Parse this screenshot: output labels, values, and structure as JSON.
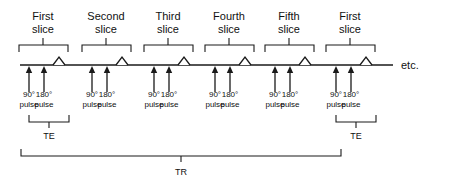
{
  "diagram": {
    "title_text": "Multi-slice spin echo pulse sequence timing diagram",
    "etc_label": "etc.",
    "axis": {
      "x_start": 20,
      "x_end": 393,
      "y": 65
    },
    "colors": {
      "ink": "#1a1a1a",
      "background": "#ffffff",
      "text": "#111111"
    },
    "slices": [
      {
        "ordinal_word": "First",
        "slice_word": "slice",
        "bracket_left": 19,
        "bracket_right": 68,
        "bracket_y": 45,
        "bracket_tick_x": 43,
        "label_x": 43,
        "pulse_90_x": 29,
        "pulse_180_x": 44,
        "echo_x": 59,
        "pulse_90_label": "90°",
        "pulse_90_sub": "pulse",
        "pulse_180_label": "180°",
        "pulse_180_sub": "pulse",
        "te_bracket": true,
        "te_label": "TE"
      },
      {
        "ordinal_word": "Second",
        "slice_word": "slice",
        "bracket_left": 82,
        "bracket_right": 131,
        "bracket_y": 45,
        "bracket_tick_x": 106,
        "label_x": 106,
        "pulse_90_x": 92,
        "pulse_180_x": 107,
        "echo_x": 122,
        "pulse_90_label": "90°",
        "pulse_90_sub": "pulse",
        "pulse_180_label": "180°",
        "pulse_180_sub": "pulse",
        "te_bracket": false,
        "te_label": ""
      },
      {
        "ordinal_word": "Third",
        "slice_word": "slice",
        "bracket_left": 144,
        "bracket_right": 193,
        "bracket_y": 45,
        "bracket_tick_x": 168,
        "label_x": 168,
        "pulse_90_x": 154,
        "pulse_180_x": 169,
        "echo_x": 184,
        "pulse_90_label": "90°",
        "pulse_90_sub": "pulse",
        "pulse_180_label": "180°",
        "pulse_180_sub": "pulse",
        "te_bracket": false,
        "te_label": ""
      },
      {
        "ordinal_word": "Fourth",
        "slice_word": "slice",
        "bracket_left": 205,
        "bracket_right": 254,
        "bracket_y": 45,
        "bracket_tick_x": 229,
        "label_x": 229,
        "pulse_90_x": 215,
        "pulse_180_x": 230,
        "echo_x": 245,
        "pulse_90_label": "90°",
        "pulse_90_sub": "pulse",
        "pulse_180_label": "180°",
        "pulse_180_sub": "pulse",
        "te_bracket": false,
        "te_label": ""
      },
      {
        "ordinal_word": "Fifth",
        "slice_word": "slice",
        "bracket_left": 265,
        "bracket_right": 314,
        "bracket_y": 45,
        "bracket_tick_x": 289,
        "label_x": 289,
        "pulse_90_x": 275,
        "pulse_180_x": 290,
        "echo_x": 305,
        "pulse_90_label": "90°",
        "pulse_90_sub": "pulse",
        "pulse_180_label": "180°",
        "pulse_180_sub": "pulse",
        "te_bracket": false,
        "te_label": ""
      },
      {
        "ordinal_word": "First",
        "slice_word": "slice",
        "bracket_left": 326,
        "bracket_right": 375,
        "bracket_y": 45,
        "bracket_tick_x": 350,
        "label_x": 350,
        "pulse_90_x": 336,
        "pulse_180_x": 351,
        "echo_x": 366,
        "pulse_90_label": "90°",
        "pulse_90_sub": "pulse",
        "pulse_180_label": "180°",
        "pulse_180_sub": "pulse",
        "te_bracket": true,
        "te_label": "TE"
      }
    ],
    "te_brackets": [
      {
        "label": "TE",
        "left": 29,
        "right": 69,
        "y": 122,
        "tick_x": 49,
        "label_x": 49,
        "label_y": 139
      },
      {
        "label": "TE",
        "left": 336,
        "right": 376,
        "y": 122,
        "tick_x": 356,
        "label_x": 356,
        "label_y": 139
      }
    ],
    "tr_bracket": {
      "label": "TR",
      "left": 21,
      "right": 341,
      "y": 156,
      "tick_x": 181,
      "label_x": 181,
      "label_y": 175
    },
    "label_rows": {
      "slice_label_line1_y": 20,
      "slice_label_line2_y": 33,
      "pulse_label_line1_y": 97,
      "pulse_label_line2_y": 107
    }
  }
}
